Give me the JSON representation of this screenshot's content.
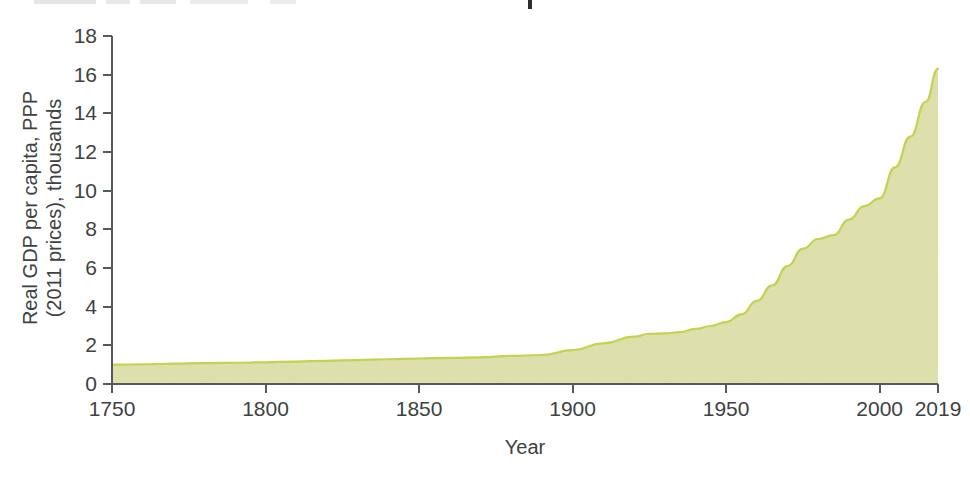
{
  "chart_data": {
    "type": "area",
    "title": "",
    "xlabel": "Year",
    "ylabel": "Real GDP per capita, PPP (2011 prices), thousands",
    "ylabel_line1": "Real GDP per capita, PPP",
    "ylabel_line2": "(2011 prices), thousands",
    "xlim": [
      1750,
      2019
    ],
    "ylim": [
      0,
      18
    ],
    "x_ticks": [
      1750,
      1800,
      1850,
      1900,
      1950,
      2000,
      2019
    ],
    "x_tick_labels": [
      "1750",
      "1800",
      "1850",
      "1900",
      "1950",
      "2000",
      "2019"
    ],
    "y_ticks": [
      0,
      2,
      4,
      6,
      8,
      10,
      12,
      14,
      16,
      18
    ],
    "y_tick_labels": [
      "0",
      "2",
      "4",
      "6",
      "8",
      "10",
      "12",
      "14",
      "16",
      "18"
    ],
    "grid": false,
    "legend": null,
    "series": [
      {
        "name": "Real GDP per capita, PPP (2011 prices), thousands",
        "fill_color": "#dfe2ac",
        "line_color": "#c5d150",
        "x": [
          1750,
          1760,
          1770,
          1780,
          1790,
          1800,
          1810,
          1820,
          1830,
          1840,
          1850,
          1860,
          1870,
          1880,
          1890,
          1900,
          1910,
          1920,
          1925,
          1930,
          1935,
          1940,
          1945,
          1950,
          1955,
          1960,
          1965,
          1970,
          1975,
          1980,
          1985,
          1990,
          1995,
          2000,
          2005,
          2010,
          2015,
          2019
        ],
        "y": [
          1.0,
          1.02,
          1.05,
          1.08,
          1.1,
          1.12,
          1.16,
          1.2,
          1.24,
          1.28,
          1.32,
          1.35,
          1.38,
          1.45,
          1.5,
          1.75,
          2.1,
          2.45,
          2.6,
          2.62,
          2.68,
          2.85,
          3.0,
          3.2,
          3.6,
          4.3,
          5.1,
          6.1,
          7.0,
          7.5,
          7.7,
          8.5,
          9.2,
          9.6,
          11.2,
          12.8,
          14.6,
          16.3
        ]
      }
    ],
    "annotations": []
  },
  "axis_colors": {
    "axis_line": "#55595a",
    "tick_label": "#3d4242",
    "background": "#ffffff"
  }
}
